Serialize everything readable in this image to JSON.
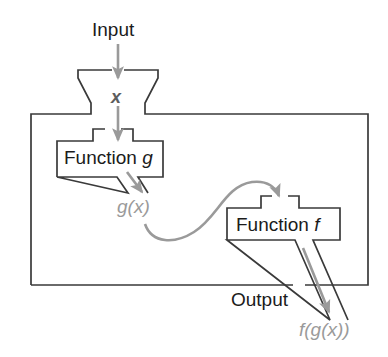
{
  "diagram": {
    "colors": {
      "outline": "#3a3a3a",
      "arrow_gray": "#9a9a9a",
      "text_dark": "#1b1b1b",
      "text_gray": "#9a9a9a",
      "variable_gray": "#5d5d5d",
      "background": "#ffffff"
    },
    "labels": {
      "input": "Input",
      "variable_x": "x",
      "function_g": "Function g",
      "function_g_name": "Function",
      "function_g_symbol": "g",
      "intermediate": "g(x)",
      "function_f": "Function f",
      "function_f_name": "Function",
      "function_f_symbol": "f",
      "output": "Output",
      "result": "f(g(x))"
    },
    "flow": [
      {
        "step": 1,
        "from": "Input",
        "to": "x",
        "via": "input-hopper"
      },
      {
        "step": 2,
        "from": "x",
        "to": "Function g",
        "via": "g-inlet-arrow"
      },
      {
        "step": 3,
        "from": "Function g",
        "to": "g(x)",
        "via": "g-outlet-arrow"
      },
      {
        "step": 4,
        "from": "g(x)",
        "to": "Function f",
        "via": "curved-feed-arrow"
      },
      {
        "step": 5,
        "from": "Function f",
        "to": "f(g(x))",
        "via": "f-outlet-arrow"
      }
    ]
  }
}
